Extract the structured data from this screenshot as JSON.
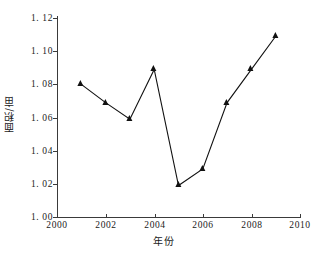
{
  "chart_data": {
    "type": "line",
    "title": "",
    "xlabel": "年份",
    "ylabel": "面积/亩",
    "xlim": [
      2000,
      2010
    ],
    "ylim": [
      1.0,
      1.12
    ],
    "grid": false,
    "legend": "none",
    "marker": "triangle",
    "x": [
      2001,
      2002,
      2003,
      2004,
      2005,
      2006,
      2007,
      2008,
      2009
    ],
    "values": [
      1.08,
      1.069,
      1.059,
      1.089,
      1.019,
      1.029,
      1.069,
      1.089,
      1.109
    ],
    "series": [
      {
        "name": "面积/亩",
        "values": [
          1.08,
          1.069,
          1.059,
          1.089,
          1.019,
          1.029,
          1.069,
          1.089,
          1.109
        ]
      }
    ],
    "xticks": [
      2000,
      2002,
      2004,
      2006,
      2008,
      2010
    ],
    "xtick_labels": [
      "2000",
      "2002",
      "2004",
      "2006",
      "2008",
      "2010"
    ],
    "yticks": [
      1.0,
      1.02,
      1.04,
      1.06,
      1.08,
      1.1,
      1.12
    ],
    "ytick_labels": [
      "1. 00",
      "1. 02",
      "1. 04",
      "1. 06",
      "1. 08",
      "1. 10",
      "1. 12"
    ],
    "line_color": "#111111",
    "marker_color": "#111111",
    "axis_color": "#3a3a3a",
    "background": "#ffffff"
  },
  "axis": {
    "y_title": "面积/亩",
    "x_title": "年份"
  },
  "ytick_labels": {
    "t0": "1. 00",
    "t1": "1. 02",
    "t2": "1. 04",
    "t3": "1. 06",
    "t4": "1. 08",
    "t5": "1. 10",
    "t6": "1. 12"
  },
  "xtick_labels": {
    "t0": "2000",
    "t1": "2002",
    "t2": "2004",
    "t3": "2006",
    "t4": "2008",
    "t5": "2010"
  }
}
